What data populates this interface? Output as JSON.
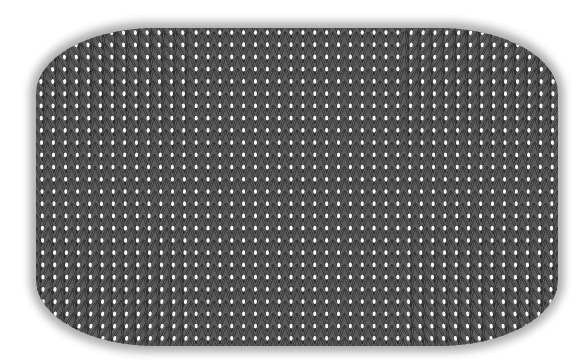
{
  "image": {
    "subject": "Knitted stockinette swatch illustration",
    "description": "Grey knitted fabric with V-shaped stitch columns, rounded rectangular outline with fuzzy edges",
    "caption": "Knit stockinette swatch"
  },
  "swatch": {
    "x": 36,
    "y": 28,
    "width": 522,
    "height": 318,
    "corner_radius": 120,
    "columns": 44,
    "rows": 26,
    "colors": {
      "background": "#ffffff",
      "fabric": "#5a5a5a",
      "stitch_light": "#6e6e6e",
      "stitch_dark": "#3a3a3a",
      "outline": "#2a2a2a",
      "highlight": "#ffffff",
      "edge_fuzz": "#8a8a8a"
    }
  }
}
